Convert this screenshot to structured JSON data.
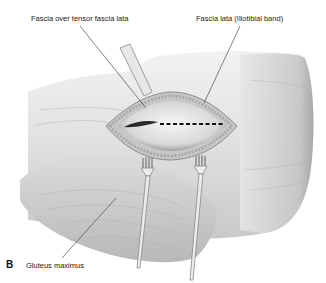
{
  "figure": {
    "panel_letter": "B",
    "labels": {
      "top_left": "Fascia over tensor fascia lata",
      "top_right": "Fascia lata (Iliotibial band)",
      "bottom": "Gluteus maximus"
    },
    "colors": {
      "background": "#ffffff",
      "skin_light": "#ececec",
      "skin_mid": "#cfcfcf",
      "skin_dark": "#9a9a9a",
      "incision_line": "#111111",
      "leader_line": "#333333"
    },
    "instruments": [
      "retractor-top",
      "rake-retractor-left",
      "rake-retractor-right"
    ]
  }
}
